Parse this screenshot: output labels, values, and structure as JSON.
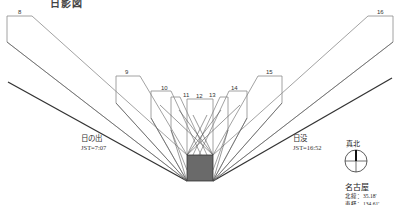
{
  "title": "日影図",
  "colors": {
    "outline": "#888888",
    "ray": "#555555",
    "sun_line": "#333333",
    "building": "#6a6a6a"
  },
  "hour_labels": [
    {
      "hour": "8"
    },
    {
      "hour": "9"
    },
    {
      "hour": "10"
    },
    {
      "hour": "11"
    },
    {
      "hour": "12"
    },
    {
      "hour": "13"
    },
    {
      "hour": "14"
    },
    {
      "hour": "15"
    },
    {
      "hour": "16"
    }
  ],
  "sunrise": {
    "label": "日の出",
    "time": "JST=7:07"
  },
  "sunset": {
    "label": "日没",
    "time": "JST=16:52"
  },
  "north": {
    "label": "真北"
  },
  "location": {
    "name": "名古屋",
    "latitude": "北緯：35.18'",
    "longitude": "東経：134.61'"
  }
}
